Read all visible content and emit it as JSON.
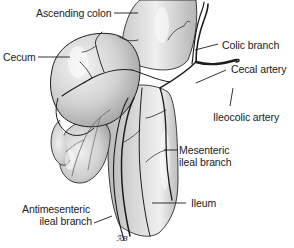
{
  "diagram": {
    "labels": {
      "ascending_colon": "Ascending colon",
      "cecum": "Cecum",
      "colic_branch": "Colic branch",
      "cecal_artery": "Cecal artery",
      "ileocolic_artery": "Ileocolic artery",
      "mesenteric_ileal_branch_line1": "Mesenteric",
      "mesenteric_ileal_branch_line2": "ileal branch",
      "ileum": "Ileum",
      "antimesenteric_ileal_branch_line1": "Antimesenteric",
      "antimesenteric_ileal_branch_line2": "ileal branch"
    },
    "signature": "ℛB",
    "colors": {
      "organ_fill": "#d4d4d4",
      "organ_highlight": "#f2f2f2",
      "organ_shadow": "#9a9a9a",
      "vessel": "#1c1c1c",
      "leader_line": "#1c1c1c",
      "background": "#ffffff"
    }
  }
}
